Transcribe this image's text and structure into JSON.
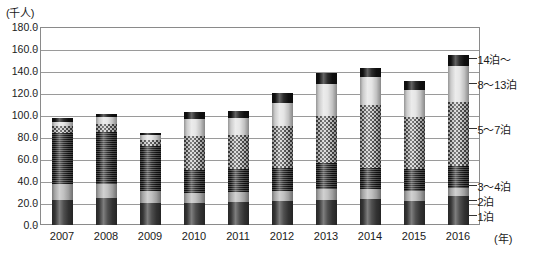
{
  "chart_data": {
    "type": "bar",
    "subtype": "stacked-column",
    "title": "",
    "unit_label": "(千人)",
    "xlabel": "(年)",
    "ylabel": "",
    "ylim": [
      0.0,
      180.0
    ],
    "ytick_step": 20.0,
    "grid": true,
    "legend_position": "right-outside",
    "categories": [
      "2007",
      "2008",
      "2009",
      "2010",
      "2011",
      "2012",
      "2013",
      "2014",
      "2015",
      "2016"
    ],
    "ytick_labels": [
      "0.0",
      "20.0",
      "40.0",
      "60.0",
      "80.0",
      "100.0",
      "120.0",
      "140.0",
      "160.0",
      "180.0"
    ],
    "series": [
      {
        "name": "1泊",
        "values": [
          23.0,
          25.0,
          20.0,
          20.0,
          21.0,
          22.0,
          23.0,
          24.0,
          22.0,
          26.0
        ]
      },
      {
        "name": "2泊",
        "values": [
          14.0,
          12.0,
          11.0,
          9.0,
          9.0,
          9.0,
          10.0,
          9.0,
          9.0,
          8.0
        ]
      },
      {
        "name": "3～4泊",
        "values": [
          47.0,
          48.0,
          41.0,
          21.0,
          21.0,
          21.0,
          23.0,
          19.0,
          20.0,
          20.0
        ]
      },
      {
        "name": "5～7泊",
        "values": [
          6.0,
          7.0,
          5.0,
          31.0,
          31.0,
          38.0,
          43.0,
          57.0,
          47.0,
          58.0
        ]
      },
      {
        "name": "8～13泊",
        "values": [
          4.0,
          6.0,
          5.0,
          15.0,
          15.0,
          21.0,
          29.0,
          26.0,
          25.0,
          33.0
        ]
      },
      {
        "name": "14泊～",
        "values": [
          3.0,
          3.0,
          2.0,
          7.0,
          7.0,
          9.0,
          10.0,
          8.0,
          8.0,
          10.0
        ]
      }
    ],
    "totals": [
      97.0,
      101.0,
      84.0,
      103.0,
      104.0,
      120.0,
      138.0,
      143.0,
      131.0,
      155.0
    ],
    "legend_entries": [
      {
        "label": "14泊～",
        "pattern": "black-solid"
      },
      {
        "label": "8～13泊",
        "pattern": "light-gradient"
      },
      {
        "label": "5～7泊",
        "pattern": "stipple-dots"
      },
      {
        "label": "3～4泊",
        "pattern": "horizontal-stripes"
      },
      {
        "label": "2泊",
        "pattern": "light-solid"
      },
      {
        "label": "1泊",
        "pattern": "dark-solid"
      }
    ]
  }
}
